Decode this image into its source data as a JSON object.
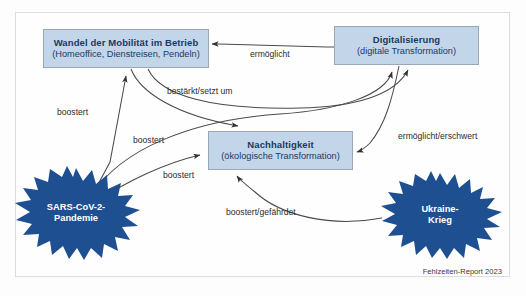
{
  "diagram": {
    "credit": "Fehlzeiten-Report 2023",
    "colors": {
      "box_fill": "#c3d5e8",
      "box_border": "#9aa7b4",
      "box_text": "#1b3a63",
      "star_fill": "#1d4f91",
      "star_text": "#ffffff",
      "edge_stroke": "#4a4a4a",
      "frame_border": "#d8dde2",
      "background": "#fefefe"
    },
    "nodes": [
      {
        "id": "wandel",
        "shape": "rectangle",
        "title": "Wandel der Mobilität im Betrieb",
        "subtitle": "(Homeoffice, Dienstreisen, Pendeln)"
      },
      {
        "id": "digitalisierung",
        "shape": "rectangle",
        "title": "Digitalisierung",
        "subtitle": "(digitale Transformation)"
      },
      {
        "id": "nachhaltigkeit",
        "shape": "rectangle",
        "title": "Nachhaltigkeit",
        "subtitle": "(ökologische Transformation)"
      },
      {
        "id": "sars",
        "shape": "star",
        "line1": "SARS-CoV-2-",
        "line2": "Pandemie"
      },
      {
        "id": "ukraine",
        "shape": "star",
        "line1": "Ukraine-",
        "line2": "Krieg"
      }
    ],
    "edges": [
      {
        "id": "digitalisierung-to-wandel",
        "from": "digitalisierung",
        "to": "wandel",
        "label": "ermöglicht"
      },
      {
        "id": "wandel-to-digitalisierung",
        "from": "wandel",
        "to": "digitalisierung",
        "label": "bestärkt/setzt um"
      },
      {
        "id": "wandel-to-nachhaltigkeit",
        "from": "wandel",
        "to": "nachhaltigkeit",
        "label": ""
      },
      {
        "id": "digitalisierung-to-nachhaltigkeit",
        "from": "digitalisierung",
        "to": "nachhaltigkeit",
        "label": "ermöglicht/erschwert"
      },
      {
        "id": "sars-to-wandel",
        "from": "sars",
        "to": "wandel",
        "label": "boostert"
      },
      {
        "id": "sars-to-digitalisierung",
        "from": "sars",
        "to": "digitalisierung",
        "label": "boostert"
      },
      {
        "id": "sars-to-nachhaltigkeit",
        "from": "sars",
        "to": "nachhaltigkeit",
        "label": "boostert"
      },
      {
        "id": "ukraine-to-nachhaltigkeit",
        "from": "ukraine",
        "to": "nachhaltigkeit",
        "label": "boostert/gefährdet"
      }
    ],
    "edge_labels": {
      "ermoeglicht": "ermöglicht",
      "bestaerkt_setzt_um": "bestärkt/setzt um",
      "boostert_1": "boostert",
      "boostert_2": "boostert",
      "boostert_3": "boostert",
      "ermoeglicht_erschwert": "ermöglicht/erschwert",
      "boostert_gefaehrdet": "boostert/gefährdet"
    }
  }
}
